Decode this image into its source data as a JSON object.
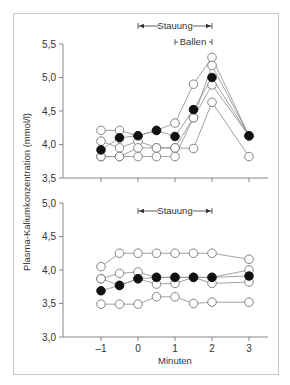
{
  "chart_data": [
    {
      "type": "line",
      "panel": "upper",
      "title": "",
      "xlabel": "Minuten",
      "ylabel": "Plasma-Kaliumkonzentration (mmol/l)",
      "x": [
        -1,
        -0.5,
        0,
        0.5,
        1,
        1.5,
        2,
        3
      ],
      "xticks": [
        "-1",
        "0",
        "1",
        "2",
        "3"
      ],
      "yticks": [
        "3,5",
        "4,0",
        "4,5",
        "5,0",
        "5,5"
      ],
      "ylim": [
        3.5,
        5.5
      ],
      "xlim": [
        -1.5,
        3.5
      ],
      "grid": false,
      "annotations": [
        {
          "label": "Stauung",
          "from": 0,
          "to": 2,
          "type": "arrow-range"
        },
        {
          "label": "Ballen",
          "from": 1,
          "to": 2,
          "type": "bracket-range"
        }
      ],
      "series": [
        {
          "name": "mean",
          "marker": "filled",
          "values": [
            3.92,
            4.1,
            4.13,
            4.21,
            4.12,
            4.52,
            5.0,
            4.13
          ]
        },
        {
          "name": "subject-1",
          "marker": "open",
          "values": [
            4.21,
            4.21,
            4.13,
            4.21,
            4.32,
            4.9,
            5.3,
            4.13
          ]
        },
        {
          "name": "subject-2",
          "marker": "open",
          "values": [
            4.05,
            3.95,
            4.05,
            3.95,
            3.95,
            4.4,
            5.18,
            4.13
          ]
        },
        {
          "name": "subject-3",
          "marker": "open",
          "values": [
            3.82,
            3.82,
            3.82,
            3.82,
            3.82,
            4.4,
            4.89,
            4.13
          ]
        },
        {
          "name": "subject-4",
          "marker": "open",
          "values": [
            3.82,
            3.82,
            3.95,
            3.95,
            3.95,
            3.94,
            4.63,
            3.82
          ]
        }
      ]
    },
    {
      "type": "line",
      "panel": "lower",
      "title": "",
      "xlabel": "Minuten",
      "ylabel": "Plasma-Kaliumkonzentration (mmol/l)",
      "x": [
        -1,
        -0.5,
        0,
        0.5,
        1,
        1.5,
        2,
        3
      ],
      "xticks": [
        "-1",
        "0",
        "1",
        "2",
        "3"
      ],
      "yticks": [
        "3,0",
        "3,5",
        "4,0",
        "4,5",
        "5,0"
      ],
      "ylim": [
        3.0,
        5.0
      ],
      "xlim": [
        -1.5,
        3.5
      ],
      "grid": false,
      "annotations": [
        {
          "label": "Stauung",
          "from": 0,
          "to": 2,
          "type": "arrow-range"
        }
      ],
      "series": [
        {
          "name": "mean",
          "marker": "filled",
          "values": [
            3.69,
            3.77,
            3.87,
            3.89,
            3.89,
            3.89,
            3.89,
            3.91
          ]
        },
        {
          "name": "subject-1",
          "marker": "open",
          "values": [
            4.05,
            4.25,
            4.25,
            4.25,
            4.25,
            4.25,
            4.25,
            4.16
          ]
        },
        {
          "name": "subject-2",
          "marker": "open",
          "values": [
            3.87,
            3.95,
            3.97,
            3.89,
            3.89,
            3.89,
            3.89,
            4.0
          ]
        },
        {
          "name": "subject-3",
          "marker": "open",
          "values": [
            3.87,
            3.77,
            3.87,
            3.79,
            3.8,
            3.89,
            3.8,
            3.82
          ]
        },
        {
          "name": "subject-4",
          "marker": "open",
          "values": [
            3.49,
            3.49,
            3.49,
            3.6,
            3.6,
            3.5,
            3.52,
            3.52
          ]
        }
      ]
    }
  ],
  "labels": {
    "ylabel": "Plasma-Kaliumkonzentration (mmol/l)",
    "xlabel": "Minuten",
    "upper_annot_stauung": "Stauung",
    "upper_annot_ballen": "Ballen",
    "lower_annot_stauung": "Stauung",
    "upper_yticks": [
      "5,5",
      "5,0",
      "4,5",
      "4,0",
      "3,5"
    ],
    "lower_yticks": [
      "5,0",
      "4,5",
      "4,0",
      "3,5",
      "3,0"
    ],
    "xticks": [
      "-1",
      "0",
      "1",
      "2",
      "3"
    ]
  },
  "colors": {
    "axis": "#888888",
    "line": "#8a8a8a",
    "marker_open_fill": "#ffffff",
    "marker_open_stroke": "#777777",
    "marker_filled": "#111111",
    "frame": "#c9c9c9"
  }
}
